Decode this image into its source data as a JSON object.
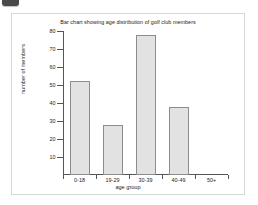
{
  "badge": {
    "name": "corner-badge"
  },
  "chart_data": {
    "type": "bar",
    "title": "Bar chart showing age distribution of golf club members",
    "xlabel": "age group",
    "ylabel": "number of members",
    "categories": [
      "0-18",
      "19-29",
      "30-39",
      "40-49",
      "50+"
    ],
    "values": [
      52,
      28,
      78,
      38,
      0
    ],
    "ylim": [
      0,
      80
    ],
    "ytick_labels": [
      "10",
      "20",
      "30",
      "40",
      "50",
      "60",
      "70",
      "80"
    ],
    "ytick_values": [
      10,
      20,
      30,
      40,
      50,
      60,
      70,
      80
    ],
    "grid": false,
    "legend": null,
    "bar_color": "#e2e2e2",
    "bar_border_color": "#8c8c8c",
    "axis_color": "#555555",
    "panel_background": "#ffffff",
    "panel_border_color": "#d8d8d8"
  }
}
